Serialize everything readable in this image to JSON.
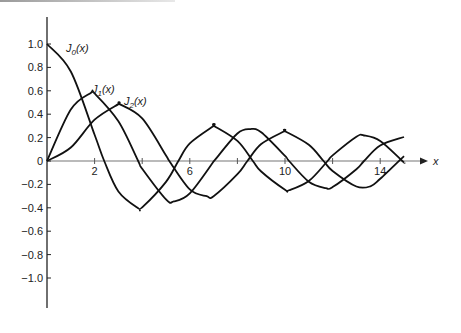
{
  "chart_data": {
    "type": "line",
    "title": "",
    "xlabel": "x",
    "ylabel": "",
    "xlim": [
      0,
      15
    ],
    "ylim": [
      -1.2,
      1.2
    ],
    "grid": false,
    "legend_position": "inline curve labels",
    "x_ticks": [
      2,
      4,
      6,
      8,
      10,
      12,
      14
    ],
    "x_tick_labels": [
      "2",
      "6",
      "10",
      "14"
    ],
    "y_ticks": [
      -1.0,
      -0.8,
      -0.6,
      -0.4,
      -0.2,
      0,
      0.2,
      0.4,
      0.6,
      0.8,
      1.0
    ],
    "y_tick_labels": [
      "-1.0",
      "-0.8",
      "-0.6",
      "-0.4",
      "-0.2",
      "0",
      "0.2",
      "0.4",
      "0.6",
      "0.8",
      "1.0"
    ],
    "series": [
      {
        "name": "J0(x)",
        "label_main": "J",
        "label_sub": "0",
        "label_tail": "(x)",
        "x": [
          0,
          1,
          2,
          2.405,
          3,
          3.83,
          4,
          5,
          5.52,
          6,
          7,
          7.02,
          8,
          8.65,
          9,
          10,
          10.17,
          11,
          11.79,
          12,
          13,
          13.32,
          14,
          14.93,
          15
        ],
        "values": [
          1.0,
          0.765,
          0.224,
          0,
          -0.26,
          -0.403,
          -0.397,
          -0.178,
          0,
          0.151,
          0.3,
          0.3,
          0.172,
          0,
          -0.09,
          -0.246,
          -0.25,
          -0.171,
          0,
          0.048,
          0.207,
          0.218,
          0.171,
          0,
          -0.014
        ]
      },
      {
        "name": "J1(x)",
        "label_main": "J",
        "label_sub": "1",
        "label_tail": "(x)",
        "x": [
          0,
          1,
          1.84,
          2,
          3,
          3.83,
          4,
          5,
          5.33,
          6,
          7,
          7.02,
          8,
          8.54,
          9,
          10,
          10.17,
          11,
          11.71,
          12,
          13,
          13.32,
          14,
          15
        ],
        "values": [
          0,
          0.44,
          0.582,
          0.577,
          0.339,
          0,
          -0.066,
          -0.328,
          -0.346,
          -0.277,
          -0.005,
          0,
          0.235,
          0.273,
          0.245,
          0.043,
          0,
          -0.177,
          -0.232,
          -0.223,
          -0.07,
          0,
          0.133,
          0.205
        ]
      },
      {
        "name": "J2(x)",
        "label_main": "J",
        "label_sub": "2",
        "label_tail": "(x)",
        "x": [
          0,
          1,
          2,
          3,
          3.05,
          4,
          5,
          5.14,
          6,
          6.71,
          7,
          8,
          8.42,
          9,
          9.97,
          10,
          11,
          11.62,
          12,
          13,
          13.59,
          14,
          15
        ],
        "values": [
          0,
          0.115,
          0.353,
          0.486,
          0.486,
          0.364,
          0.047,
          0,
          -0.243,
          -0.301,
          -0.301,
          -0.113,
          0,
          0.145,
          0.254,
          0.255,
          0.139,
          0,
          -0.085,
          -0.218,
          -0.216,
          -0.152,
          0.042
        ]
      }
    ]
  },
  "axes": {
    "x_axis_label": "x"
  }
}
